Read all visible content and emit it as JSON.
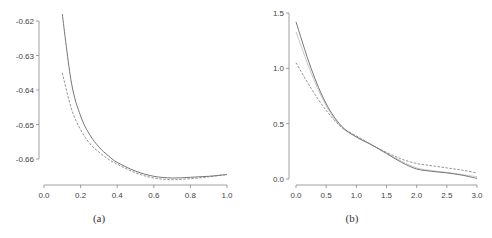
{
  "chart_data": [
    {
      "type": "line",
      "title": "",
      "caption": "(a)",
      "xlabel": "",
      "ylabel": "",
      "xlim": [
        0.0,
        1.0
      ],
      "ylim": [
        -0.668,
        -0.618
      ],
      "xticks": [
        "0.0",
        "0.2",
        "0.4",
        "0.6",
        "0.8",
        "1.0"
      ],
      "yticks": [
        "-0.62",
        "-0.63",
        "-0.64",
        "-0.65",
        "-0.66"
      ],
      "grid": false,
      "legend": null,
      "series": [
        {
          "name": "solid",
          "style": "solid",
          "x": [
            0.1,
            0.15,
            0.2,
            0.25,
            0.3,
            0.35,
            0.4,
            0.5,
            0.6,
            0.7,
            0.8,
            0.9,
            1.0
          ],
          "values": [
            -0.618,
            -0.638,
            -0.6475,
            -0.653,
            -0.6565,
            -0.659,
            -0.661,
            -0.6635,
            -0.665,
            -0.6655,
            -0.6653,
            -0.665,
            -0.6645
          ]
        },
        {
          "name": "dashed",
          "style": "dashed",
          "x": [
            0.1,
            0.15,
            0.2,
            0.25,
            0.3,
            0.35,
            0.4,
            0.5,
            0.6,
            0.7,
            0.8,
            0.9,
            1.0
          ],
          "values": [
            -0.635,
            -0.6455,
            -0.6515,
            -0.6555,
            -0.658,
            -0.66,
            -0.6615,
            -0.664,
            -0.6655,
            -0.666,
            -0.6657,
            -0.6652,
            -0.6645
          ]
        }
      ]
    },
    {
      "type": "line",
      "title": "",
      "caption": "(b)",
      "xlabel": "",
      "ylabel": "",
      "xlim": [
        0.0,
        3.0
      ],
      "ylim": [
        0.0,
        1.5
      ],
      "xticks": [
        "0.0",
        "0.5",
        "1.0",
        "1.5",
        "2.0",
        "2.5",
        "3.0"
      ],
      "yticks": [
        "0.0",
        "0.5",
        "1.0",
        "1.5"
      ],
      "grid": false,
      "legend": null,
      "series": [
        {
          "name": "solid",
          "style": "solid",
          "x": [
            0.0,
            0.25,
            0.5,
            0.75,
            1.0,
            1.25,
            1.5,
            1.75,
            2.0,
            2.25,
            2.5,
            2.75,
            3.0
          ],
          "values": [
            1.42,
            1.0,
            0.68,
            0.48,
            0.38,
            0.31,
            0.23,
            0.15,
            0.09,
            0.07,
            0.055,
            0.035,
            0.005
          ]
        },
        {
          "name": "dashed",
          "style": "dashed",
          "x": [
            0.0,
            0.25,
            0.5,
            0.75,
            1.0,
            1.25,
            1.5,
            1.75,
            2.0,
            2.25,
            2.5,
            2.75,
            3.0
          ],
          "values": [
            1.05,
            0.82,
            0.62,
            0.47,
            0.39,
            0.31,
            0.24,
            0.18,
            0.14,
            0.12,
            0.1,
            0.08,
            0.055
          ]
        },
        {
          "name": "light",
          "style": "light-solid",
          "x": [
            0.0,
            0.25,
            0.5,
            0.75,
            1.0,
            1.25,
            1.5,
            1.75,
            2.0,
            2.25,
            2.5,
            2.75,
            3.0
          ],
          "values": [
            1.33,
            0.96,
            0.66,
            0.47,
            0.38,
            0.31,
            0.235,
            0.16,
            0.1,
            0.075,
            0.06,
            0.04,
            0.02
          ]
        }
      ]
    }
  ]
}
